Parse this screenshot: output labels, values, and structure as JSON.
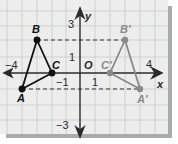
{
  "figure": {
    "colors": {
      "paper": "#ecedec",
      "grid": "#c9cbca",
      "axis": "#2b2b2b",
      "original": "#111111",
      "image": "#8a8a8a",
      "dashed": "#333333",
      "shadow": "#a9abaa"
    },
    "axes": {
      "x_label": "x",
      "y_label": "y",
      "origin_label": "O",
      "x_ticks": [
        {
          "label": "−4",
          "value": -4
        },
        {
          "label": "−1",
          "value": -1
        },
        {
          "label": "1",
          "value": 1
        },
        {
          "label": "4",
          "value": 4
        }
      ],
      "y_ticks": [
        {
          "label": "3",
          "value": 3
        },
        {
          "label": "1",
          "value": 1
        },
        {
          "label": "−3",
          "value": -3
        }
      ]
    },
    "triangle_original": {
      "points": [
        {
          "label": "A",
          "x": -4,
          "y": -1
        },
        {
          "label": "B",
          "x": -3,
          "y": 2
        },
        {
          "label": "C",
          "x": -2,
          "y": 0
        }
      ]
    },
    "triangle_image": {
      "points": [
        {
          "label": "A'",
          "x": 4,
          "y": -1
        },
        {
          "label": "B'",
          "x": 3,
          "y": 2
        },
        {
          "label": "C'",
          "x": 2,
          "y": 0
        }
      ]
    },
    "labels": {
      "A": "A",
      "B": "B",
      "C": "C",
      "A_prime": "A′",
      "B_prime": "B′",
      "C_prime": "C′",
      "x": "x",
      "y": "y",
      "O": "O",
      "tick_neg4": "−4",
      "tick_neg1": "−1",
      "tick_1x": "1",
      "tick_4": "4",
      "tick_3": "3",
      "tick_1y": "1",
      "tick_neg3": "−3"
    }
  }
}
